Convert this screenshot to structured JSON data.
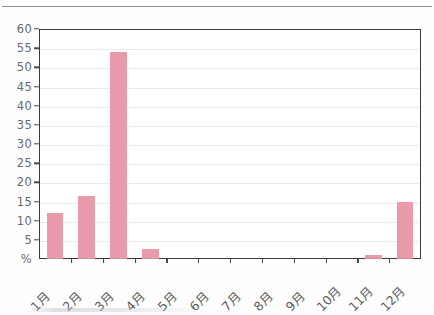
{
  "chart_data": {
    "type": "bar",
    "title": "",
    "subtitle": "",
    "xlabel": "",
    "ylabel": "%",
    "categories": [
      "1月",
      "2月",
      "3月",
      "4月",
      "5月",
      "6月",
      "7月",
      "8月",
      "9月",
      "10月",
      "11月",
      "12月"
    ],
    "values": [
      12,
      16.5,
      54,
      2.5,
      0,
      0,
      0,
      0,
      0,
      0,
      1,
      15
    ],
    "ylim": [
      0,
      60
    ],
    "yticks": [
      0,
      5,
      10,
      15,
      20,
      25,
      30,
      35,
      40,
      45,
      50,
      55,
      60
    ],
    "ytick_labels": [
      "%",
      "5",
      "10",
      "15",
      "20",
      "25",
      "30",
      "35",
      "40",
      "45",
      "50",
      "55",
      "60"
    ],
    "grid": true,
    "legend": false,
    "legend_position": "none",
    "series": [
      {
        "name": "",
        "values": [
          12,
          16.5,
          54,
          2.5,
          0,
          0,
          0,
          0,
          0,
          0,
          1,
          15
        ],
        "color": "#e893a2"
      }
    ]
  },
  "colors": {
    "bar": "#e893a2",
    "frame": "#3b3b3b",
    "gridline": "#eceaee",
    "tick_text": "#6a6a6a",
    "axis_label_text": "#5d5d5d",
    "top_rule": "#8d8d8d",
    "background": "#ffffff"
  }
}
